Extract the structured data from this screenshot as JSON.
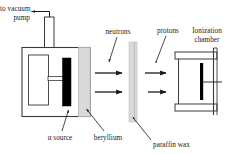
{
  "figure": {
    "type": "physics-apparatus-diagram",
    "background_color": "#ffffff",
    "line_color": "#1a1a1a",
    "fill_colors": {
      "alpha_source": "#000000",
      "beryllium": "#d9d9d9",
      "paraffin_wax": "#d9d9d9",
      "chamber_body": "#ffffff",
      "electrode": "#000000"
    }
  },
  "labels": {
    "vacuum_pump_line1": "to vacuum",
    "vacuum_pump_line2": "pump",
    "neutrons": "neutrons",
    "protons": "protons",
    "ionization_line1": "Ionization",
    "ionization_line2": "chamber",
    "alpha_source": "α source",
    "beryllium": "beryllium",
    "paraffin_wax": "paraffin wax"
  },
  "components": [
    {
      "name": "vacuum-chamber",
      "label": "vacuum chamber"
    },
    {
      "name": "alpha-source",
      "label": "α source"
    },
    {
      "name": "beryllium-target",
      "label": "beryllium"
    },
    {
      "name": "paraffin-wax-slab",
      "label": "paraffin wax"
    },
    {
      "name": "ionization-chamber",
      "label": "Ionization chamber"
    }
  ],
  "particle_beams": [
    {
      "name": "neutrons",
      "count": 2,
      "direction": "right"
    },
    {
      "name": "protons",
      "count": 2,
      "direction": "right"
    }
  ]
}
